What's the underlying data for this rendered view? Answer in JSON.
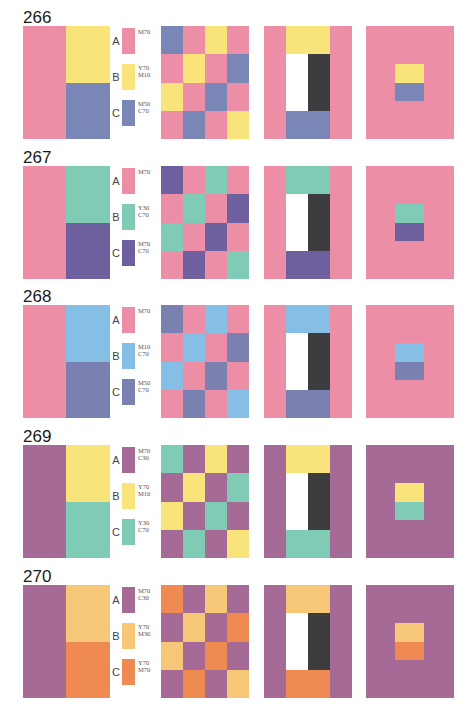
{
  "sections": [
    {
      "number": "266",
      "colors": {
        "A": "#ec8fa6",
        "B": "#f8e47a",
        "C": "#7a86b5"
      },
      "legend": [
        {
          "letter": "A",
          "code": "M70"
        },
        {
          "letter": "B",
          "code": "Y70\nM10"
        },
        {
          "letter": "C",
          "code": "M50\nC70"
        }
      ],
      "grid": [
        "C",
        "A",
        "B",
        "A",
        "A",
        "B",
        "A",
        "C",
        "B",
        "A",
        "C",
        "A",
        "A",
        "C",
        "A",
        "B"
      ]
    },
    {
      "number": "267",
      "colors": {
        "A": "#ec8fa6",
        "B": "#7fcbb6",
        "C": "#6e5f9f"
      },
      "legend": [
        {
          "letter": "A",
          "code": "M70"
        },
        {
          "letter": "B",
          "code": "Y30\nC70"
        },
        {
          "letter": "C",
          "code": "M70\nC70"
        }
      ],
      "grid": [
        "C",
        "A",
        "B",
        "A",
        "A",
        "B",
        "A",
        "C",
        "B",
        "A",
        "C",
        "A",
        "A",
        "C",
        "A",
        "B"
      ]
    },
    {
      "number": "268",
      "colors": {
        "A": "#ec8fa6",
        "B": "#86bfe6",
        "C": "#7a80b0"
      },
      "legend": [
        {
          "letter": "A",
          "code": "M70"
        },
        {
          "letter": "B",
          "code": "M10\nC70"
        },
        {
          "letter": "C",
          "code": "M50\nC70"
        }
      ],
      "grid": [
        "C",
        "A",
        "B",
        "A",
        "A",
        "B",
        "A",
        "C",
        "B",
        "A",
        "C",
        "A",
        "A",
        "C",
        "A",
        "B"
      ]
    },
    {
      "number": "269",
      "colors": {
        "A": "#a56a95",
        "B": "#f8e47a",
        "C": "#7fcbb6"
      },
      "legend": [
        {
          "letter": "A",
          "code": "M70\nC30"
        },
        {
          "letter": "B",
          "code": "Y70\nM10"
        },
        {
          "letter": "C",
          "code": "Y30\nC70"
        }
      ],
      "grid": [
        "C",
        "A",
        "B",
        "A",
        "A",
        "B",
        "A",
        "C",
        "B",
        "A",
        "C",
        "A",
        "A",
        "C",
        "A",
        "B"
      ]
    },
    {
      "number": "270",
      "colors": {
        "A": "#a56a95",
        "B": "#f6c777",
        "C": "#ee8a52"
      },
      "legend": [
        {
          "letter": "A",
          "code": "M70\nC30"
        },
        {
          "letter": "B",
          "code": "Y70\nM30"
        },
        {
          "letter": "C",
          "code": "Y70\nM70"
        }
      ],
      "grid": [
        "C",
        "A",
        "B",
        "A",
        "A",
        "B",
        "A",
        "C",
        "B",
        "A",
        "C",
        "A",
        "A",
        "C",
        "A",
        "B"
      ]
    }
  ]
}
